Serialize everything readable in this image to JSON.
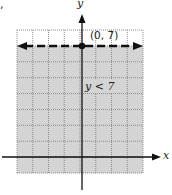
{
  "corner_mark": ",",
  "chart_data": {
    "type": "line",
    "title": "",
    "inequality": "y < 7",
    "boundary": {
      "equation": "y = 7",
      "style": "dashed",
      "x_range": [
        -4,
        4
      ]
    },
    "shaded_region": "below boundary",
    "labeled_point": {
      "x": 0,
      "y": 7,
      "label": "(0, 7)"
    },
    "xlabel": "x",
    "ylabel": "y",
    "xlim": [
      -4,
      4
    ],
    "ylim": [
      -1,
      8
    ],
    "grid": true
  },
  "labels": {
    "point": "(0, 7)",
    "inequality": "y < 7",
    "x_axis": "x",
    "y_axis": "y"
  },
  "colors": {
    "shade": "#d4d4d4",
    "grid": "#8a8a8a",
    "line": "#111111"
  }
}
